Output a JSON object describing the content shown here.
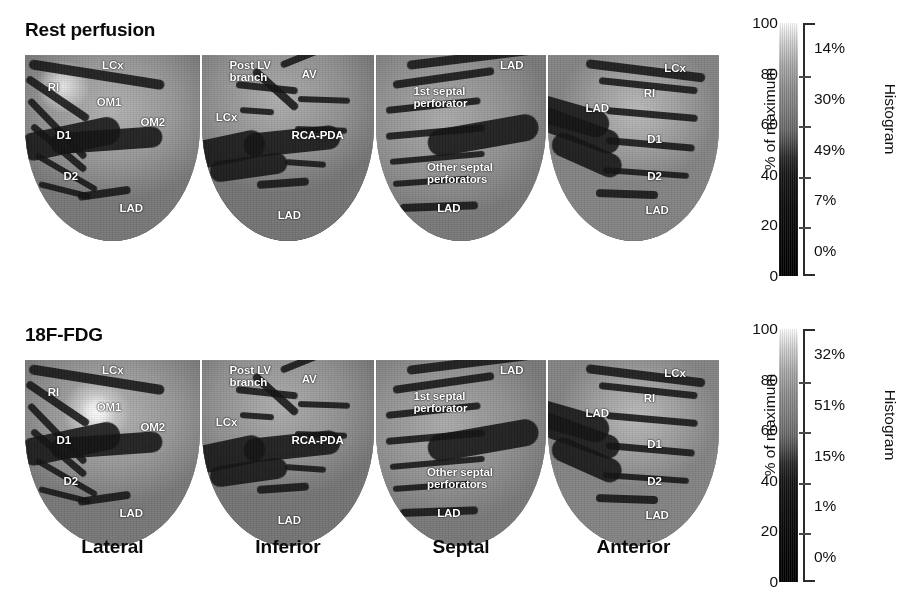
{
  "figure": {
    "rows": [
      {
        "id": "rest",
        "title": "Rest perfusion",
        "colorbar": {
          "axis_unit": "% of maximum",
          "axis_ticks": [
            "100",
            "80",
            "60",
            "40",
            "20",
            "0"
          ],
          "histogram_title": "Histogram",
          "bins": [
            "14%",
            "30%",
            "49%",
            "7%",
            "0%"
          ]
        },
        "panels": [
          {
            "view": "Lateral",
            "labels": [
              {
                "text": "LCx",
                "x": 0.44,
                "y": 0.02
              },
              {
                "text": "RI",
                "x": 0.13,
                "y": 0.14
              },
              {
                "text": "OM1",
                "x": 0.41,
                "y": 0.22
              },
              {
                "text": "OM2",
                "x": 0.66,
                "y": 0.33
              },
              {
                "text": "D1",
                "x": 0.18,
                "y": 0.4
              },
              {
                "text": "D2",
                "x": 0.22,
                "y": 0.62
              },
              {
                "text": "LAD",
                "x": 0.54,
                "y": 0.79
              }
            ]
          },
          {
            "view": "Inferior",
            "labels": [
              {
                "text": "Post LV\nbranch",
                "x": 0.16,
                "y": 0.02
              },
              {
                "text": "AV",
                "x": 0.58,
                "y": 0.07
              },
              {
                "text": "LCx",
                "x": 0.08,
                "y": 0.3
              },
              {
                "text": "RCA-PDA",
                "x": 0.52,
                "y": 0.4
              },
              {
                "text": "LAD",
                "x": 0.44,
                "y": 0.83
              }
            ]
          },
          {
            "view": "Septal",
            "labels": [
              {
                "text": "LAD",
                "x": 0.73,
                "y": 0.02
              },
              {
                "text": "1st septal\nperforator",
                "x": 0.22,
                "y": 0.16
              },
              {
                "text": "Other septal\nperforators",
                "x": 0.3,
                "y": 0.57
              },
              {
                "text": "LAD",
                "x": 0.36,
                "y": 0.79
              }
            ]
          },
          {
            "view": "Anterior",
            "labels": [
              {
                "text": "LCx",
                "x": 0.68,
                "y": 0.04
              },
              {
                "text": "RI",
                "x": 0.56,
                "y": 0.17
              },
              {
                "text": "LAD",
                "x": 0.22,
                "y": 0.25
              },
              {
                "text": "D1",
                "x": 0.58,
                "y": 0.42
              },
              {
                "text": "D2",
                "x": 0.58,
                "y": 0.62
              },
              {
                "text": "LAD",
                "x": 0.57,
                "y": 0.8
              }
            ]
          }
        ]
      },
      {
        "id": "fdg",
        "title": "18F-FDG",
        "colorbar": {
          "axis_unit": "% of maximum",
          "axis_ticks": [
            "100",
            "80",
            "60",
            "40",
            "20",
            "0"
          ],
          "histogram_title": "Histogram",
          "bins": [
            "32%",
            "51%",
            "15%",
            "1%",
            "0%"
          ]
        },
        "panels": [
          {
            "view": "Lateral",
            "labels": [
              {
                "text": "LCx",
                "x": 0.44,
                "y": 0.02
              },
              {
                "text": "RI",
                "x": 0.13,
                "y": 0.14
              },
              {
                "text": "OM1",
                "x": 0.41,
                "y": 0.22
              },
              {
                "text": "OM2",
                "x": 0.66,
                "y": 0.33
              },
              {
                "text": "D1",
                "x": 0.18,
                "y": 0.4
              },
              {
                "text": "D2",
                "x": 0.22,
                "y": 0.62
              },
              {
                "text": "LAD",
                "x": 0.54,
                "y": 0.79
              }
            ]
          },
          {
            "view": "Inferior",
            "labels": [
              {
                "text": "Post LV\nbranch",
                "x": 0.16,
                "y": 0.02
              },
              {
                "text": "AV",
                "x": 0.58,
                "y": 0.07
              },
              {
                "text": "LCx",
                "x": 0.08,
                "y": 0.3
              },
              {
                "text": "RCA-PDA",
                "x": 0.52,
                "y": 0.4
              },
              {
                "text": "LAD",
                "x": 0.44,
                "y": 0.83
              }
            ]
          },
          {
            "view": "Septal",
            "labels": [
              {
                "text": "LAD",
                "x": 0.73,
                "y": 0.02
              },
              {
                "text": "1st septal\nperforator",
                "x": 0.22,
                "y": 0.16
              },
              {
                "text": "Other septal\nperforators",
                "x": 0.3,
                "y": 0.57
              },
              {
                "text": "LAD",
                "x": 0.36,
                "y": 0.79
              }
            ]
          },
          {
            "view": "Anterior",
            "labels": [
              {
                "text": "LCx",
                "x": 0.68,
                "y": 0.04
              },
              {
                "text": "RI",
                "x": 0.56,
                "y": 0.17
              },
              {
                "text": "LAD",
                "x": 0.22,
                "y": 0.25
              },
              {
                "text": "D1",
                "x": 0.58,
                "y": 0.42
              },
              {
                "text": "D2",
                "x": 0.58,
                "y": 0.62
              },
              {
                "text": "LAD",
                "x": 0.57,
                "y": 0.8
              }
            ]
          }
        ]
      }
    ],
    "view_names": [
      "Lateral",
      "Inferior",
      "Septal",
      "Anterior"
    ]
  },
  "chart_data": {
    "type": "heatmap",
    "colormap": "grayscale (white = 100% of maximum, black = 0%)",
    "ylabel": "% of maximum",
    "ylim": [
      0,
      100
    ],
    "yticks": [
      0,
      20,
      40,
      60,
      80,
      100
    ],
    "legend_position": "right",
    "grid": false,
    "views": [
      "Lateral",
      "Inferior",
      "Septal",
      "Anterior"
    ],
    "panels": [
      {
        "row": "Rest perfusion",
        "histogram_label": "Histogram",
        "histogram_bins": [
          {
            "range_pct": [
              80,
              100
            ],
            "value": 14,
            "label": "14%"
          },
          {
            "range_pct": [
              60,
              80
            ],
            "value": 30,
            "label": "30%"
          },
          {
            "range_pct": [
              40,
              60
            ],
            "value": 49,
            "label": "49%"
          },
          {
            "range_pct": [
              20,
              40
            ],
            "value": 7,
            "label": "7%"
          },
          {
            "range_pct": [
              0,
              20
            ],
            "value": 0,
            "label": "0%"
          }
        ]
      },
      {
        "row": "18F-FDG",
        "histogram_label": "Histogram",
        "histogram_bins": [
          {
            "range_pct": [
              80,
              100
            ],
            "value": 32,
            "label": "32%"
          },
          {
            "range_pct": [
              60,
              80
            ],
            "value": 51,
            "label": "51%"
          },
          {
            "range_pct": [
              40,
              60
            ],
            "value": 15,
            "label": "15%"
          },
          {
            "range_pct": [
              20,
              40
            ],
            "value": 1,
            "label": "1%"
          },
          {
            "range_pct": [
              0,
              20
            ],
            "value": 0,
            "label": "0%"
          }
        ]
      }
    ],
    "coronary_annotations": {
      "Lateral": [
        "LCx",
        "RI",
        "OM1",
        "OM2",
        "D1",
        "D2",
        "LAD"
      ],
      "Inferior": [
        "Post LV branch",
        "AV",
        "LCx",
        "RCA-PDA",
        "LAD"
      ],
      "Septal": [
        "LAD",
        "1st septal perforator",
        "Other septal perforators",
        "LAD"
      ],
      "Anterior": [
        "LCx",
        "RI",
        "LAD",
        "D1",
        "D2",
        "LAD"
      ]
    }
  }
}
